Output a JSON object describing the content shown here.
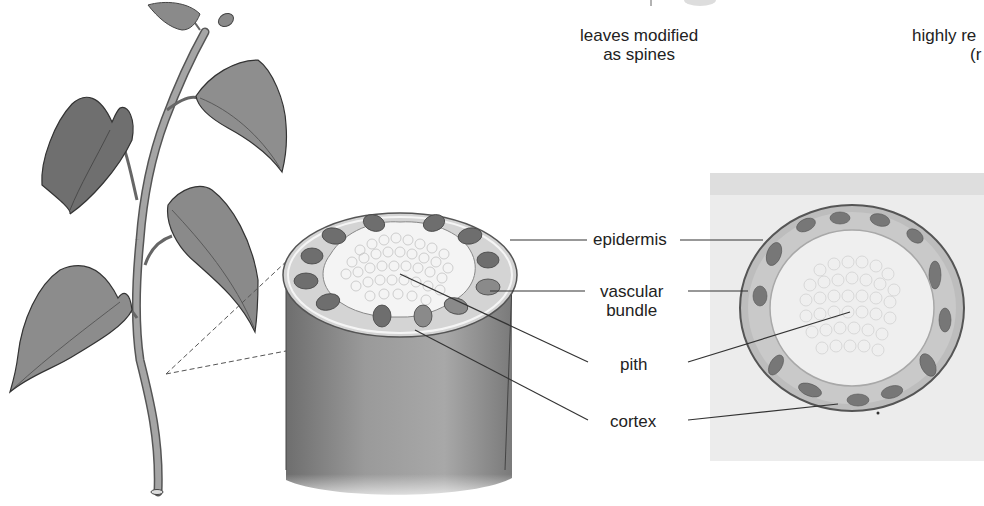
{
  "top_captions": {
    "left": [
      "leaves modified",
      "as spines"
    ],
    "right": [
      "highly re",
      "(r"
    ]
  },
  "labels": {
    "epidermis": "epidermis",
    "vascular_bundle": [
      "vascular",
      "bundle"
    ],
    "pith": "pith",
    "cortex": "cortex"
  },
  "figure_parts": {
    "plant_illustration": "plant-shoot",
    "stem_cross_section": "stem-3d-section",
    "micrograph": "stem-cross-section-micrograph"
  },
  "colors": {
    "ink": "#222222",
    "leaf": "#7d7d7d",
    "stem": "#8a8a8a",
    "pith": "#f2f2f2",
    "cortex": "#cfcfcf",
    "bundle": "#6a6a6a",
    "photo_bg": "#e4e4e4"
  }
}
